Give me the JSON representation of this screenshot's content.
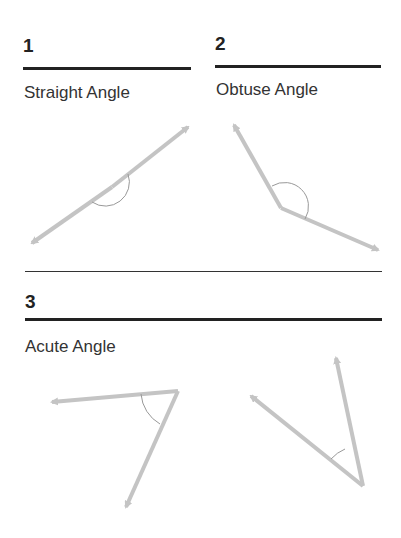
{
  "sections": [
    {
      "number": "1",
      "label": "Straight Angle"
    },
    {
      "number": "2",
      "label": "Obtuse Angle"
    },
    {
      "number": "3",
      "label": "Acute Angle"
    }
  ],
  "colors": {
    "ray": "#c4c4c4",
    "arc": "#999999",
    "rule": "#222222"
  }
}
